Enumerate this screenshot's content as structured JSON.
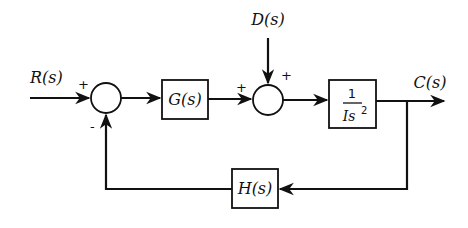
{
  "diagram": {
    "type": "control-system-block-diagram",
    "signals": {
      "input": "R(s)",
      "disturbance": "D(s)",
      "output": "C(s)"
    },
    "blocks": {
      "controller": "G(s)",
      "plant": {
        "numerator": "1",
        "denominator": "Is",
        "denominator_exponent": "2"
      },
      "feedback": "H(s)"
    },
    "summing_junctions": {
      "sum1": {
        "input_sign": "+",
        "feedback_sign": "-"
      },
      "sum2": {
        "forward_sign": "+",
        "disturbance_sign": "+"
      }
    },
    "colors": {
      "line": "#111111",
      "background": "#ffffff"
    }
  }
}
